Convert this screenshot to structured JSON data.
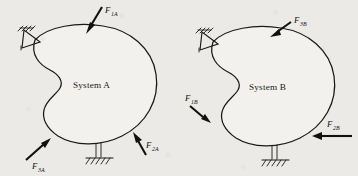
{
  "figure": {
    "background_color": "#eceae6",
    "ink_color": "#1a1a1a",
    "systems": [
      {
        "id": "system-a",
        "label": "System A",
        "supports": [
          {
            "kind": "pin-support",
            "position": "upper-left"
          },
          {
            "kind": "post-ground-support",
            "position": "bottom"
          }
        ],
        "forces": [
          {
            "name": "F1A",
            "symbol": "F",
            "subscript": "1A",
            "direction": "down-left-into-top-edge"
          },
          {
            "name": "F2A",
            "symbol": "F",
            "subscript": "2A",
            "direction": "up-left-into-lower-right-edge"
          },
          {
            "name": "F3A",
            "symbol": "F",
            "subscript": "3A",
            "direction": "up-right-into-lower-left-edge"
          }
        ]
      },
      {
        "id": "system-b",
        "label": "System B",
        "supports": [
          {
            "kind": "pin-support",
            "position": "upper-left"
          },
          {
            "kind": "post-ground-support",
            "position": "bottom"
          }
        ],
        "forces": [
          {
            "name": "F1B",
            "symbol": "F",
            "subscript": "1B",
            "direction": "down-right-into-left-notch"
          },
          {
            "name": "F2B",
            "symbol": "F",
            "subscript": "2B",
            "direction": "left-horizontal-into-right-edge"
          },
          {
            "name": "F3B",
            "symbol": "F",
            "subscript": "3B",
            "direction": "down-left-into-top-edge"
          }
        ]
      }
    ]
  }
}
